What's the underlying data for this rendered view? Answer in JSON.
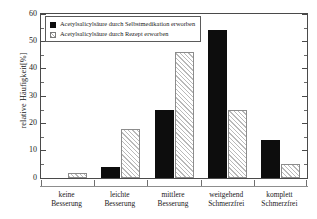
{
  "chart_data": {
    "type": "bar",
    "title": "",
    "xlabel": "",
    "ylabel": "relative Häufigkeit[%]",
    "ylim": [
      0,
      60
    ],
    "yticks": [
      0,
      10,
      20,
      30,
      40,
      50,
      60
    ],
    "grid": false,
    "legend_position": "top-left",
    "categories": [
      "keine Besserung",
      "leichte Besserung",
      "mittlere Besserung",
      "weitgehend Schmerzfrei",
      "komplett Schmerzfrei"
    ],
    "category_lines": [
      [
        "keine",
        "Besserung"
      ],
      [
        "leichte",
        "Besserung"
      ],
      [
        "mittlere",
        "Besserung"
      ],
      [
        "weitgehend",
        "Schmerzfrei"
      ],
      [
        "komplett",
        "Schmerzfrei"
      ]
    ],
    "series": [
      {
        "name": "Acetylsalicylsäure durch Selbstmedikation erworben",
        "name_lines": [
          "Acetylsalicylsäure durch",
          "Selbstmedikation erworben"
        ],
        "fill": "solid-black",
        "color": "#0d0d0d",
        "values": [
          0,
          4,
          25,
          54,
          14
        ]
      },
      {
        "name": "Acetylsalicylsäure durch Rezept erworben",
        "name_lines": [
          "Acetylsalicylsäure durch",
          "Rezept erworben"
        ],
        "fill": "hatched",
        "color": "#b9b9b9",
        "values": [
          2,
          18,
          46,
          25,
          5
        ]
      }
    ]
  },
  "axis": {
    "y_title": "relative Häufigkeit[%]",
    "y_tick_labels": [
      "0",
      "10",
      "20",
      "30",
      "40",
      "50",
      "60"
    ]
  }
}
